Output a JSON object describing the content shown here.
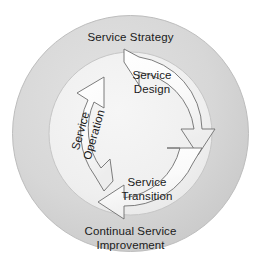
{
  "diagram": {
    "title_visible": false,
    "outer_ring": {
      "top_label": "Service Strategy",
      "bottom_label_line1": "Continual Service",
      "bottom_label_line2": "Improvement",
      "fill_color": "#d6d6d6",
      "stroke_color": "#b8b8b8"
    },
    "inner_circle": {
      "fill_color": "#f0f0f0",
      "stroke_color": "#c4c4c4"
    },
    "arrows": [
      {
        "id": "service-design",
        "label_line1": "Service",
        "label_line2": "Design",
        "position": "top-right",
        "direction": "clockwise",
        "fill_color": "#f7f7f7",
        "stroke_color": "#6e6e6e"
      },
      {
        "id": "service-transition",
        "label_line1": "Service",
        "label_line2": "Transition",
        "position": "bottom",
        "direction": "clockwise",
        "fill_color": "#fbfbfb",
        "stroke_color": "#6e6e6e"
      },
      {
        "id": "service-operation",
        "label_line1": "Service",
        "label_line2": "Operation",
        "position": "left",
        "direction": "clockwise",
        "rotation_degrees": -74,
        "fill_color": "#fbfbfb",
        "stroke_color": "#6e6e6e"
      }
    ]
  }
}
